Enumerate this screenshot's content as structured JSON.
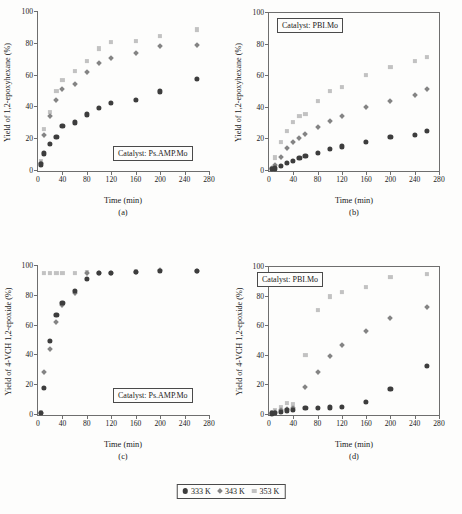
{
  "figure": {
    "background": "#fdfdfc",
    "legend": {
      "position": "bottom-center",
      "entries": [
        {
          "label": "333 K",
          "marker": "circle",
          "color": "#3d3d3d"
        },
        {
          "label": "343 K",
          "marker": "diamond",
          "color": "#848484"
        },
        {
          "label": "353 K",
          "marker": "square",
          "color": "#c2c2c2"
        }
      ]
    }
  },
  "chart_data": [
    {
      "id": "a",
      "type": "scatter",
      "caption": "(a)",
      "annotation": "Catalyst: Ps.AMP.Mo",
      "title": "",
      "xlabel": "Time (min)",
      "ylabel": "Yield of 1,2-epoxyhexane (%)",
      "xlim": [
        0,
        280
      ],
      "ylim": [
        0,
        100
      ],
      "xticks": [
        0,
        40,
        80,
        120,
        160,
        200,
        240,
        280
      ],
      "yticks": [
        0,
        20,
        40,
        60,
        80,
        100
      ],
      "grid": false,
      "frame": "left-bottom",
      "series": [
        {
          "name": "333 K",
          "marker": "circle",
          "color": "#3d3d3d",
          "x": [
            5,
            10,
            20,
            30,
            40,
            60,
            80,
            100,
            120,
            160,
            200,
            260
          ],
          "y": [
            4,
            11,
            17,
            21.5,
            28,
            30.5,
            35.5,
            39.5,
            42.5,
            44.5,
            50,
            58,
            58
          ]
        },
        {
          "name": "343 K",
          "marker": "diamond",
          "color": "#848484",
          "x": [
            5,
            10,
            20,
            30,
            40,
            60,
            80,
            100,
            120,
            160,
            200,
            260
          ],
          "y": [
            5,
            22.5,
            34.5,
            44.5,
            51.5,
            54.5,
            62,
            68,
            71,
            74,
            78.5,
            79,
            84
          ]
        },
        {
          "name": "353 K",
          "marker": "square",
          "color": "#c2c2c2",
          "x": [
            5,
            10,
            20,
            30,
            40,
            60,
            80,
            100,
            120,
            160,
            200,
            260
          ],
          "y": [
            6,
            26.5,
            37,
            50.5,
            57,
            63,
            69,
            77,
            81,
            81.5,
            85,
            89,
            89
          ]
        }
      ]
    },
    {
      "id": "b",
      "type": "scatter",
      "caption": "(b)",
      "annotation": "Catalyst: PBI.Mo",
      "title": "",
      "xlabel": "Time (min)",
      "ylabel": "Yield of 1,2-epoxyhexane (%)",
      "xlim": [
        0,
        280
      ],
      "ylim": [
        0,
        100
      ],
      "xticks": [
        0,
        40,
        80,
        120,
        160,
        200,
        240,
        280
      ],
      "yticks": [
        0,
        20,
        40,
        60,
        80,
        100
      ],
      "grid": false,
      "frame": "full",
      "series": [
        {
          "name": "333 K",
          "marker": "circle",
          "color": "#3d3d3d",
          "x": [
            5,
            10,
            20,
            30,
            40,
            50,
            60,
            80,
            100,
            120,
            160,
            200,
            240,
            260
          ],
          "y": [
            1,
            1.5,
            3,
            5,
            6.5,
            8,
            9.5,
            11.5,
            14,
            15.5,
            18.5,
            21.5,
            22.5,
            25.5
          ]
        },
        {
          "name": "343 K",
          "marker": "diamond",
          "color": "#848484",
          "x": [
            5,
            10,
            20,
            30,
            40,
            50,
            60,
            80,
            100,
            120,
            160,
            200,
            240,
            260
          ],
          "y": [
            1.5,
            4,
            9,
            14.5,
            18,
            20.5,
            23.5,
            27.5,
            31.5,
            35,
            40.5,
            44.5,
            48,
            51.5
          ]
        },
        {
          "name": "353 K",
          "marker": "square",
          "color": "#c2c2c2",
          "x": [
            5,
            10,
            20,
            30,
            40,
            50,
            60,
            80,
            100,
            120,
            160,
            200,
            240,
            260
          ],
          "y": [
            2,
            8.5,
            18.5,
            25.5,
            31,
            35,
            36,
            44.5,
            50.5,
            53,
            60.5,
            66,
            69.5,
            72
          ]
        }
      ]
    },
    {
      "id": "c",
      "type": "scatter",
      "caption": "(c)",
      "annotation": "Catalyst: Ps.AMP.Mo",
      "title": "",
      "xlabel": "Time (min)",
      "ylabel": "Yield of 4-VCH 1,2-epoxide (%)",
      "xlim": [
        0,
        280
      ],
      "ylim": [
        0,
        100
      ],
      "xticks": [
        0,
        40,
        80,
        120,
        160,
        200,
        240,
        280
      ],
      "yticks": [
        0,
        20,
        40,
        60,
        80,
        100
      ],
      "grid": false,
      "frame": "left-bottom",
      "series": [
        {
          "name": "333 K",
          "marker": "circle",
          "color": "#3d3d3d",
          "x": [
            5,
            10,
            20,
            30,
            40,
            60,
            80,
            100,
            120,
            160,
            200,
            260
          ],
          "y": [
            1.5,
            18,
            49.5,
            67,
            75,
            83,
            91,
            95.5,
            95.5,
            96,
            96.5,
            96.5,
            96
          ]
        },
        {
          "name": "343 K",
          "marker": "diamond",
          "color": "#848484",
          "x": [
            5,
            10,
            20,
            30,
            40,
            60,
            80,
            100,
            120,
            160,
            200,
            260
          ],
          "y": [
            1.5,
            29,
            44,
            62,
            74,
            81.5,
            95.5,
            95.5,
            95.5,
            96,
            97,
            96.5,
            96
          ]
        },
        {
          "name": "353 K",
          "marker": "square",
          "color": "#c2c2c2",
          "x": [
            5,
            10,
            20,
            30,
            40,
            60,
            80,
            100,
            120,
            160,
            200,
            260
          ],
          "y": [
            2,
            95,
            95.5,
            95.5,
            95.5,
            95.5,
            96,
            95.5,
            95.5,
            96.5,
            96.5,
            96.5,
            96
          ]
        }
      ]
    },
    {
      "id": "d",
      "type": "scatter",
      "caption": "(d)",
      "annotation": "Catalyst: PBI.Mo",
      "title": "",
      "xlabel": "Time (min)",
      "ylabel": "Yield of 4-VCH 1,2-epoxide (%)",
      "xlim": [
        0,
        280
      ],
      "ylim": [
        0,
        100
      ],
      "xticks": [
        0,
        40,
        80,
        120,
        160,
        200,
        240,
        280
      ],
      "yticks": [
        0,
        20,
        40,
        60,
        80,
        100
      ],
      "grid": false,
      "frame": "full",
      "series": [
        {
          "name": "333 K",
          "marker": "circle",
          "color": "#3d3d3d",
          "x": [
            5,
            10,
            20,
            30,
            40,
            60,
            80,
            100,
            120,
            160,
            200,
            260
          ],
          "y": [
            1,
            1.5,
            2,
            3,
            3.5,
            4.5,
            4.5,
            5,
            5.5,
            8.5,
            17.5,
            33
          ]
        },
        {
          "name": "343 K",
          "marker": "diamond",
          "color": "#848484",
          "x": [
            5,
            10,
            20,
            30,
            40,
            60,
            80,
            100,
            120,
            160,
            200,
            260
          ],
          "y": [
            1.5,
            2,
            3,
            4,
            4.5,
            18.5,
            29,
            39.5,
            47.5,
            56.5,
            65.5,
            73
          ]
        },
        {
          "name": "353 K",
          "marker": "square",
          "color": "#c2c2c2",
          "x": [
            5,
            10,
            20,
            30,
            40,
            60,
            80,
            100,
            120,
            160,
            200,
            260
          ],
          "y": [
            2,
            3,
            5,
            8,
            7,
            40.5,
            71,
            80,
            83,
            86.5,
            93,
            95
          ]
        }
      ]
    }
  ]
}
